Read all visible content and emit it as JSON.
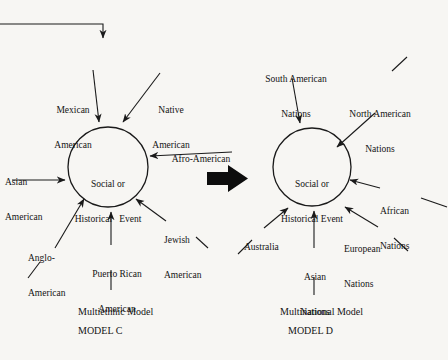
{
  "figure": {
    "background_color": "#f7f6f3",
    "ink_color": "#1a1a1a",
    "entry_arrow": {
      "name": "incoming-flow-arrow",
      "description": "horizontal line from left edge turning down into the figure"
    },
    "transition_arrow": {
      "name": "model-transition-arrow",
      "glyph": "solid right-pointing block arrow"
    }
  },
  "model_c": {
    "node_line1": "Social or",
    "node_line2": "Historical   Event",
    "caption_title": "Multiethnic Model",
    "caption_id": "MODEL C",
    "inputs": [
      {
        "id": "mexican-american",
        "line1": "Mexican",
        "line2": "American"
      },
      {
        "id": "native-american",
        "line1": "Native",
        "line2": "American"
      },
      {
        "id": "afro-american",
        "line1": "Afro-American",
        "line2": ""
      },
      {
        "id": "asian-american",
        "line1": "Asian",
        "line2": "American"
      },
      {
        "id": "anglo-american",
        "line1": "Anglo-",
        "line2": "American"
      },
      {
        "id": "puerto-rican-american",
        "line1": "Puerto Rican",
        "line2": "American"
      },
      {
        "id": "jewish-american",
        "line1": "Jewish",
        "line2": "American"
      }
    ]
  },
  "model_d": {
    "node_line1": "Social or",
    "node_line2": "Historical Event",
    "caption_title": "Multinational Model",
    "caption_id": "MODEL D",
    "inputs": [
      {
        "id": "south-american-nations",
        "line1": "South American",
        "line2": "Nations"
      },
      {
        "id": "north-american-nations",
        "line1": "North American",
        "line2": "Nations"
      },
      {
        "id": "african-nations",
        "line1": "African",
        "line2": "Nations"
      },
      {
        "id": "european-nations",
        "line1": "European",
        "line2": "Nations"
      },
      {
        "id": "asian-nations",
        "line1": "Asian",
        "line2": "Nations"
      },
      {
        "id": "australia",
        "line1": "Australia",
        "line2": ""
      }
    ]
  }
}
